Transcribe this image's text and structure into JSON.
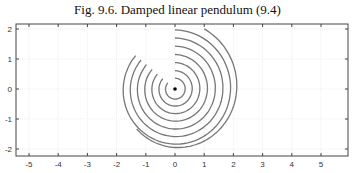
{
  "title": "Fig. 9.6.  Damped linear pendulum (9.4)",
  "chart_data": {
    "type": "line",
    "title": "Fig. 9.6.  Damped linear pendulum (9.4)",
    "xlabel": "",
    "ylabel": "",
    "xlim": [
      -5.5,
      6
    ],
    "ylim": [
      -2.2,
      2.1
    ],
    "xticks": [
      -5,
      -4,
      -3,
      -2,
      -1,
      0,
      1,
      2,
      3,
      4,
      5
    ],
    "yticks": [
      -2,
      -1,
      0,
      1,
      2
    ],
    "grid": true,
    "series": [
      {
        "name": "trajectory r=2.0 (outer)",
        "start": [
          1.0,
          2.0
        ],
        "end": [
          -1.6,
          -0.3
        ]
      },
      {
        "name": "trajectory r=2.0",
        "start": [
          0,
          2.0
        ],
        "end": [
          -1.0,
          1.0
        ]
      },
      {
        "name": "trajectory r=1.7",
        "start": [
          0,
          1.7
        ],
        "end": [
          -0.85,
          0.85
        ]
      },
      {
        "name": "trajectory r=1.4",
        "start": [
          0,
          1.4
        ],
        "end": [
          -0.7,
          0.7
        ]
      },
      {
        "name": "trajectory r=1.15",
        "start": [
          0,
          1.15
        ],
        "end": [
          -0.57,
          0.57
        ]
      },
      {
        "name": "trajectory r=0.9",
        "start": [
          0,
          0.9
        ],
        "end": [
          -0.45,
          0.45
        ]
      },
      {
        "name": "trajectory r=0.6",
        "start": [
          0,
          0.6
        ],
        "end": [
          -0.3,
          0.3
        ]
      },
      {
        "name": "trajectory r=0.35",
        "start": [
          0,
          0.35
        ],
        "end": [
          -0.18,
          0.18
        ]
      }
    ],
    "equilibrium_point": [
      0,
      0
    ]
  }
}
